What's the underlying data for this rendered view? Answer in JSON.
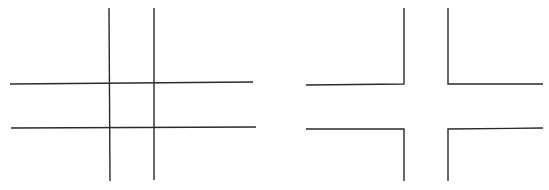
{
  "diagram": {
    "line_color": "#2a2a2a",
    "background": "#ffffff",
    "figures": [
      {
        "name": "crossing-grid",
        "description": "Two vertical and two horizontal lines crossing to form a hash / tic-tac-toe grid",
        "lines": [
          {
            "x1": 109,
            "y1": 8,
            "x2": 110,
            "y2": 181
          },
          {
            "x1": 154,
            "y1": 8,
            "x2": 154,
            "y2": 180
          },
          {
            "x1": 10,
            "y1": 84,
            "x2": 253,
            "y2": 82
          },
          {
            "x1": 11,
            "y1": 128,
            "x2": 256,
            "y2": 127
          }
        ]
      },
      {
        "name": "separated-corners",
        "description": "Four L-shaped corner brackets forming a plus-shaped gap (grid with the center crossings removed)",
        "polylines": [
          {
            "points": "306,85 404,84 404,8"
          },
          {
            "points": "448,8 448,84 543,84"
          },
          {
            "points": "306,129 404,129 404,181"
          },
          {
            "points": "448,181 448,129 543,128"
          }
        ]
      }
    ]
  }
}
